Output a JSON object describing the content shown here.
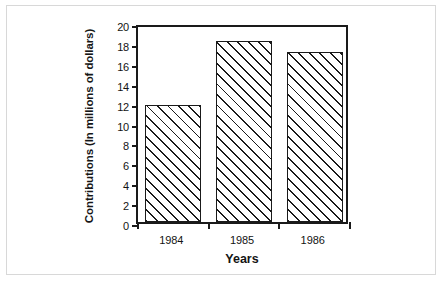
{
  "chart_data": {
    "type": "bar",
    "title": "",
    "categories": [
      "1984",
      "1985",
      "1986"
    ],
    "values": [
      11.8,
      18.2,
      17.1
    ],
    "series": [
      {
        "name": "Contributions",
        "values": [
          11.8,
          18.2,
          17.1
        ]
      }
    ],
    "xlabel": "Years",
    "ylabel": "Contributions (In millions of dollars)",
    "ylim": [
      0,
      20
    ],
    "yticks": [
      0,
      2,
      4,
      6,
      8,
      10,
      12,
      14,
      16,
      18,
      20
    ],
    "ytick_labels": [
      "0",
      "2",
      "4",
      "6",
      "8",
      "10",
      "12",
      "14",
      "16",
      "18",
      "20"
    ],
    "grid": false,
    "legend": null,
    "bar_fill": "diagonal-hatch",
    "bar_edge_color": "#1a1a1a",
    "background_color": "#ffffff"
  },
  "axis": {
    "y_title": "Contributions (In millions of dollars)",
    "x_title": "Years"
  }
}
